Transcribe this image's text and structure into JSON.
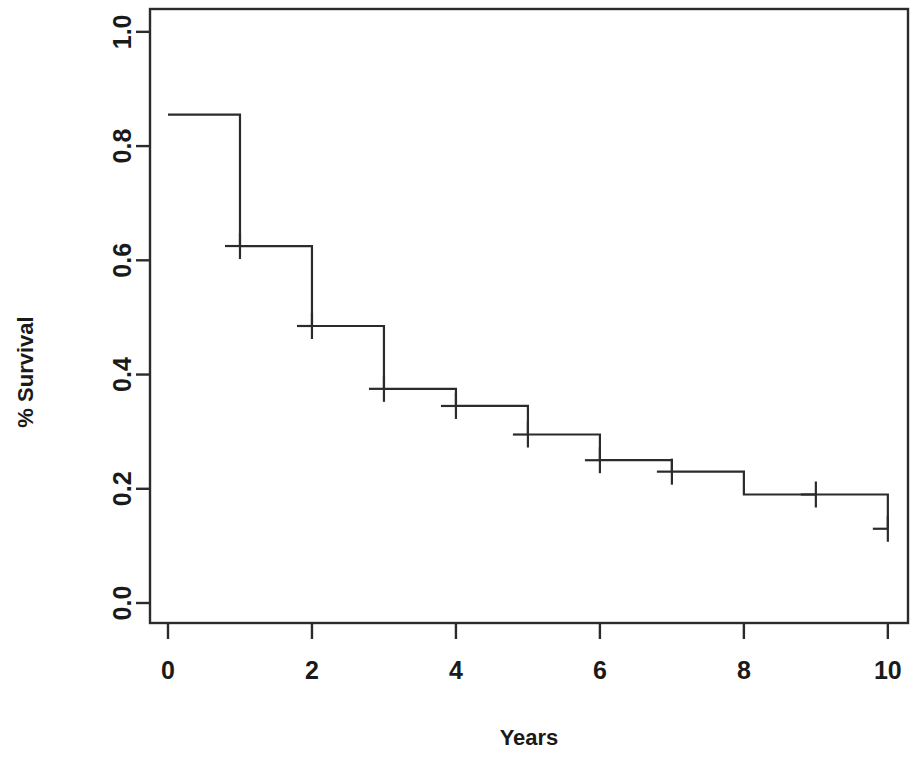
{
  "figure": {
    "background_color": "#ffffff",
    "line_color": "#2b2b2b",
    "width": 921,
    "height": 767
  },
  "chart_data": {
    "type": "line",
    "subtype": "kaplan-meier-step",
    "title": "",
    "xlabel": "Years",
    "ylabel": "% Survival",
    "xlim": [
      -0.25,
      10.28
    ],
    "ylim": [
      -0.035,
      1.04
    ],
    "grid": false,
    "legend": null,
    "x_ticks": [
      0,
      2,
      4,
      6,
      8,
      10
    ],
    "x_tick_labels": [
      "0",
      "2",
      "4",
      "6",
      "8",
      "10"
    ],
    "y_ticks": [
      0.0,
      0.2,
      0.4,
      0.6,
      0.8,
      1.0
    ],
    "y_tick_labels": [
      "0.0",
      "0.2",
      "0.4",
      "0.6",
      "0.8",
      "1.0"
    ],
    "series": [
      {
        "name": "Survival",
        "step": "post",
        "x": [
          0,
          1,
          2,
          3,
          4,
          5,
          6,
          7,
          8,
          10
        ],
        "y": [
          0.855,
          0.625,
          0.485,
          0.375,
          0.345,
          0.295,
          0.25,
          0.23,
          0.19,
          0.13
        ]
      }
    ],
    "censor_marks": [
      {
        "x": 1,
        "y": 0.625
      },
      {
        "x": 2,
        "y": 0.485
      },
      {
        "x": 3,
        "y": 0.375
      },
      {
        "x": 4,
        "y": 0.345
      },
      {
        "x": 5,
        "y": 0.295
      },
      {
        "x": 6,
        "y": 0.25
      },
      {
        "x": 7,
        "y": 0.23
      },
      {
        "x": 9,
        "y": 0.19
      },
      {
        "x": 10,
        "y": 0.13
      }
    ]
  },
  "labels": {
    "y_axis_title": "% Survival",
    "x_axis_title": "Years"
  }
}
